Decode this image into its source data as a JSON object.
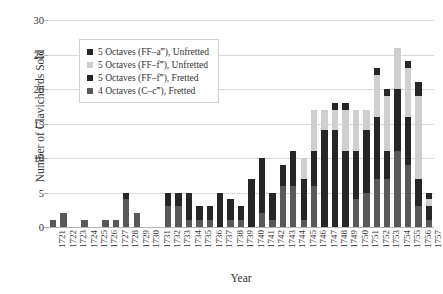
{
  "chart_data": {
    "type": "bar",
    "stacked": true,
    "title": "",
    "xlabel": "Year",
    "ylabel": "Number of Clavichords Sold",
    "ylim": [
      0,
      30
    ],
    "yticks": [
      0,
      5,
      10,
      15,
      20,
      25,
      30
    ],
    "grid": true,
    "legend_position": "upper-left-inside",
    "categories": [
      "1721",
      "1722",
      "1723",
      "1724",
      "1725",
      "1726",
      "1727",
      "1728",
      "1729",
      "1730",
      "1731",
      "1732",
      "1733",
      "1734",
      "1735",
      "1736",
      "1737",
      "1738",
      "1739",
      "1740",
      "1741",
      "1742",
      "1743",
      "1744",
      "1745",
      "1746",
      "1747",
      "1748",
      "1749",
      "1750",
      "1751",
      "1752",
      "1753",
      "1754",
      "1755",
      "1756",
      "1757"
    ],
    "series": [
      {
        "name": "4 Octaves (C–c‴), Fretted",
        "color": "#595959",
        "values": [
          1,
          2,
          0,
          1,
          0,
          1,
          1,
          4,
          2,
          0,
          0,
          3,
          3,
          1,
          1,
          1,
          0,
          1,
          1,
          0,
          2,
          1,
          6,
          6,
          1,
          6,
          0,
          0,
          0,
          4,
          5,
          7,
          7,
          11,
          9,
          3,
          1
        ]
      },
      {
        "name": "5 Octaves (FF–f‴), Fretted",
        "color": "#262626",
        "values": [
          0,
          0,
          0,
          0,
          0,
          0,
          0,
          1,
          0,
          0,
          0,
          2,
          2,
          4,
          2,
          2,
          5,
          3,
          2,
          7,
          7,
          4,
          3,
          5,
          6,
          5,
          14,
          14,
          11,
          7,
          9,
          9,
          4,
          9,
          7,
          4,
          2
        ]
      },
      {
        "name": "5 Octaves (FF–f‴), Unfretted",
        "color": "#cfcfcf",
        "values": [
          0,
          0,
          0,
          0,
          0,
          0,
          0,
          0,
          0,
          0,
          0,
          0,
          0,
          0,
          0,
          0,
          0,
          0,
          0,
          0,
          0,
          0,
          0,
          0,
          3,
          6,
          3,
          3,
          6,
          6,
          3,
          6,
          8,
          6,
          7,
          12,
          1
        ]
      },
      {
        "name": "5 Octaves (FF–a‴), Unfretted",
        "color": "#262626",
        "values": [
          0,
          0,
          0,
          0,
          0,
          0,
          0,
          0,
          0,
          0,
          0,
          0,
          0,
          0,
          0,
          0,
          0,
          0,
          0,
          0,
          1,
          0,
          0,
          0,
          0,
          0,
          0,
          1,
          1,
          0,
          0,
          1,
          1,
          0,
          1,
          2,
          1
        ]
      }
    ],
    "totals": [
      1,
      2,
      0,
      1,
      0,
      1,
      1,
      5,
      2,
      0,
      0,
      5,
      5,
      5,
      3,
      3,
      5,
      4,
      3,
      7,
      10,
      5,
      9,
      11,
      10,
      17,
      17,
      18,
      18,
      17,
      17,
      23,
      20,
      26,
      24,
      21,
      5
    ]
  },
  "legend": {
    "items": [
      {
        "label": "5 Octaves (FF–a‴), Unfretted",
        "color": "#262626"
      },
      {
        "label": "5 Octaves (FF–f‴), Unfretted",
        "color": "#cfcfcf"
      },
      {
        "label": "5 Octaves (FF–f‴), Fretted",
        "color": "#262626"
      },
      {
        "label": "4 Octaves (C–c‴), Fretted",
        "color": "#595959"
      }
    ]
  },
  "axes": {
    "y_title": "Number of Clavichords Sold",
    "x_title": "Year"
  },
  "colors": {
    "grid": "#d9d9d9",
    "axis": "#b0b0b0",
    "text": "#333333",
    "background": "#ffffff"
  }
}
